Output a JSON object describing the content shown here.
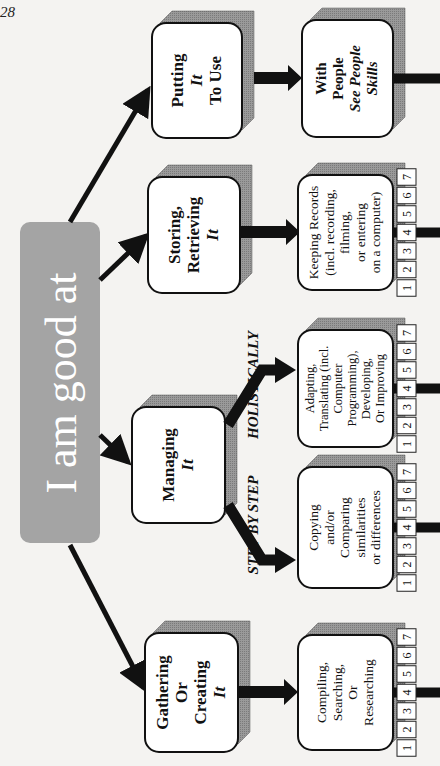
{
  "page_number": "28",
  "center": {
    "label": "I am good at",
    "color": "#a4a4a4"
  },
  "categories": [
    {
      "id": "gathering",
      "lines": [
        "Gathering",
        "Or",
        "Creating"
      ],
      "italic": "It"
    },
    {
      "id": "managing",
      "lines": [
        "Managing"
      ],
      "italic": "It"
    },
    {
      "id": "storing",
      "lines": [
        "Storing,",
        "Retrieving"
      ],
      "italic": "It"
    },
    {
      "id": "putting",
      "lines": [
        "Putting"
      ],
      "italic": "It",
      "after": [
        "To Use"
      ]
    }
  ],
  "branch_labels": {
    "step": "STEP BY STEP",
    "holistic": "HOLISTICALLY"
  },
  "skills": [
    {
      "id": "compiling",
      "lines": [
        "Compiling,",
        "Searching,",
        "Or",
        "Researching"
      ]
    },
    {
      "id": "copying",
      "lines": [
        "Copying",
        "and/or",
        "Comparing",
        "similarities",
        "or differences"
      ]
    },
    {
      "id": "adapting",
      "lines": [
        "Adapting,",
        "Translating (incl.",
        "Computer",
        "Programming),",
        "Developing,",
        "Or Improving"
      ]
    },
    {
      "id": "keeping",
      "lines": [
        "Keeping Records",
        "(incl. recording,",
        "filming,",
        "or entering",
        "on a computer)"
      ]
    },
    {
      "id": "people",
      "bold": [
        "With",
        "People"
      ],
      "italic_lines": [
        "See People",
        "Skills"
      ]
    }
  ],
  "rating_scale": [
    "1",
    "2",
    "3",
    "4",
    "5",
    "6",
    "7"
  ]
}
